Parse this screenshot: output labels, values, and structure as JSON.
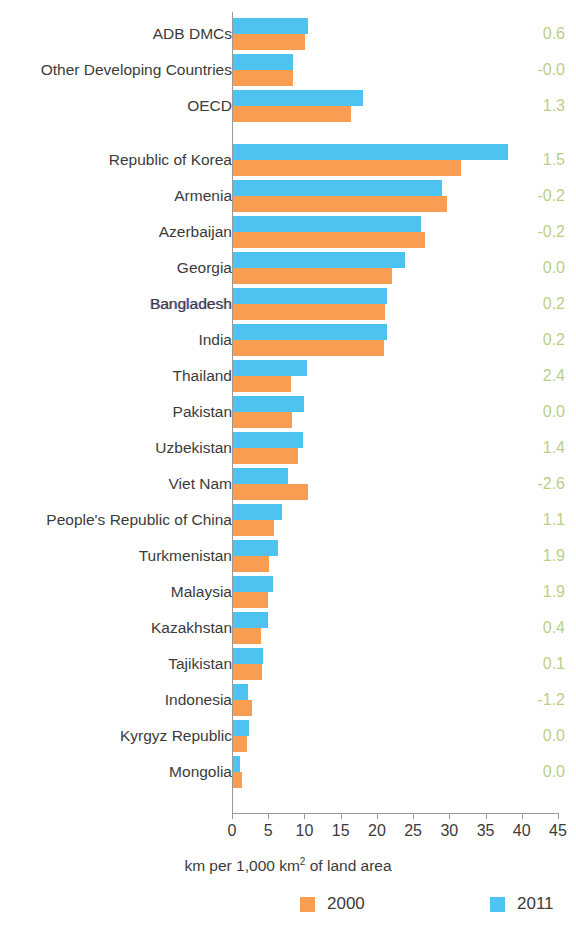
{
  "chart_data": {
    "type": "bar",
    "orientation": "horizontal",
    "title": "",
    "xlabel": "km per 1,000 km² of land area",
    "ylabel": "",
    "xlim": [
      0,
      45
    ],
    "xticks": [
      0,
      5,
      10,
      15,
      20,
      25,
      30,
      35,
      40,
      45
    ],
    "grid": false,
    "legend_position": "bottom",
    "colors": {
      "2000": "#F99D52",
      "2011": "#4FC3F0",
      "value_label": "#b9d089"
    },
    "series": [
      {
        "name": "2000",
        "color": "#F99D52",
        "values": [
          10.0,
          8.3,
          16.3,
          31.5,
          29.5,
          26.5,
          22.0,
          21.0,
          20.8,
          8.0,
          8.2,
          9.0,
          10.3,
          5.6,
          5.0,
          4.8,
          3.8,
          4.0,
          2.6,
          1.9,
          1.2
        ]
      },
      {
        "name": "2011",
        "color": "#4FC3F0",
        "values": [
          10.3,
          8.3,
          18.0,
          37.9,
          28.8,
          26.0,
          23.7,
          21.3,
          21.3,
          10.2,
          9.8,
          9.7,
          7.6,
          6.8,
          6.2,
          5.5,
          4.8,
          4.2,
          2.1,
          2.2,
          1.0
        ]
      }
    ],
    "categories": [
      "ADB DMCs",
      "Other Developing Countries",
      "OECD",
      "Republic of Korea",
      "Armenia",
      "Azerbaijan",
      "Georgia",
      "Bangladesh",
      "India",
      "Thailand",
      "Pakistan",
      "Uzbekistan",
      "Viet Nam",
      "People's Republic of China",
      "Turkmenistan",
      "Malaysia",
      "Kazakhstan",
      "Tajikistan",
      "Indonesia",
      "Kyrgyz Republic",
      "Mongolia"
    ],
    "annotations": {
      "label": "growth rate",
      "values": [
        "0.6",
        "-0.0",
        "1.3",
        "1.5",
        "-0.2",
        "-0.2",
        "0.0",
        "0.2",
        "0.2",
        "2.4",
        "0.0",
        "1.4",
        "-2.6",
        "1.1",
        "1.9",
        "1.9",
        "0.4",
        "0.1",
        "-1.2",
        "0.0",
        "0.0"
      ]
    },
    "group_gaps_after": [
      2
    ]
  },
  "legend": {
    "items": [
      {
        "label": "2000",
        "color": "#F99D52"
      },
      {
        "label": "2011",
        "color": "#4FC3F0"
      }
    ]
  },
  "axis": {
    "x_title_main": "km per 1,000 km",
    "x_title_sup": "2",
    "x_title_tail": " of land area"
  }
}
